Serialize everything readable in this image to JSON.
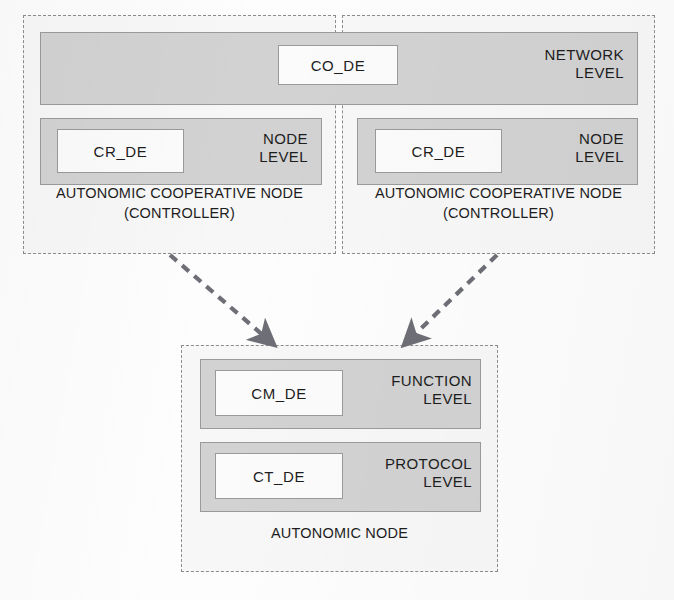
{
  "diagram": {
    "colors": {
      "bar_fill": "#d2d2d2",
      "bar_stroke": "#9a9a9a",
      "box_fill": "#fbfbfb",
      "box_stroke": "#9a9a9a",
      "dashed_stroke": "#8c8c8c",
      "arrow": "#6e6e76",
      "text": "#1d1d1d",
      "background": "#fdfdfd"
    },
    "containers": [
      {
        "id": "left-controller",
        "caption": "AUTONOMIC COOPERATIVE NODE\n(CONTROLLER)",
        "style": "dashed"
      },
      {
        "id": "right-controller",
        "caption": "AUTONOMIC COOPERATIVE NODE\n(CONTROLLER)",
        "style": "dashed"
      },
      {
        "id": "autonomic-node",
        "caption": "AUTONOMIC NODE",
        "style": "dashed"
      }
    ],
    "levels": [
      {
        "id": "network-level",
        "caption": "NETWORK\nLEVEL",
        "de_label": "CO_DE"
      },
      {
        "id": "node-level-left",
        "caption": "NODE\nLEVEL",
        "de_label": "CR_DE"
      },
      {
        "id": "node-level-right",
        "caption": "NODE\nLEVEL",
        "de_label": "CR_DE"
      },
      {
        "id": "function-level",
        "caption": "FUNCTION\nLEVEL",
        "de_label": "CM_DE"
      },
      {
        "id": "protocol-level",
        "caption": "PROTOCOL\nLEVEL",
        "de_label": "CT_DE"
      }
    ],
    "arrows": [
      {
        "id": "arrow-left-to-node",
        "from": "left-controller",
        "to": "autonomic-node",
        "style": "dashed"
      },
      {
        "id": "arrow-right-to-node",
        "from": "right-controller",
        "to": "autonomic-node",
        "style": "dashed"
      }
    ]
  }
}
